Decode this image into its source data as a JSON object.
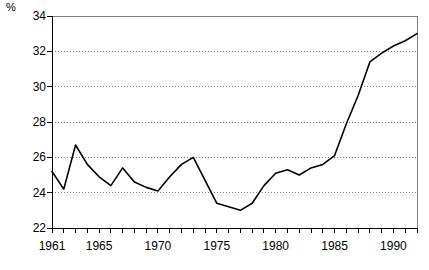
{
  "chart_data": {
    "type": "line",
    "title": "",
    "xlabel": "",
    "ylabel": "%",
    "ylim": [
      22,
      34
    ],
    "xlim": [
      1961,
      1992
    ],
    "ytick_step": 2,
    "yticks": [
      22,
      24,
      26,
      28,
      30,
      32,
      34
    ],
    "ytick_labels": [
      "22",
      "24",
      "26",
      "28",
      "30",
      "32",
      "34"
    ],
    "xticks": [
      1961,
      1965,
      1970,
      1975,
      1980,
      1985,
      1990
    ],
    "xtick_labels": [
      "1961",
      "1965",
      "1970",
      "1975",
      "1980",
      "1985",
      "1990"
    ],
    "xtick_minor_every": 1,
    "grid": "horizontal-dotted",
    "legend": "none",
    "line_color": "#000000",
    "grid_color": "#808080",
    "frame_color": "#808080",
    "x": [
      1961,
      1962,
      1963,
      1964,
      1965,
      1966,
      1967,
      1968,
      1969,
      1970,
      1971,
      1972,
      1973,
      1974,
      1975,
      1976,
      1977,
      1978,
      1979,
      1980,
      1981,
      1982,
      1983,
      1984,
      1985,
      1986,
      1987,
      1988,
      1989,
      1990,
      1991,
      1992
    ],
    "values": [
      25.2,
      24.2,
      26.7,
      25.6,
      24.9,
      24.4,
      25.4,
      24.6,
      24.3,
      24.1,
      24.9,
      25.6,
      26.0,
      24.7,
      23.4,
      23.2,
      23.0,
      23.4,
      24.4,
      25.1,
      25.3,
      25.0,
      25.4,
      25.6,
      26.1,
      27.9,
      29.5,
      31.4,
      31.9,
      32.3,
      32.6,
      33.0
    ],
    "series": [
      {
        "name": "percent-series",
        "values": [
          25.2,
          24.2,
          26.7,
          25.6,
          24.9,
          24.4,
          25.4,
          24.6,
          24.3,
          24.1,
          24.9,
          25.6,
          26.0,
          24.7,
          23.4,
          23.2,
          23.0,
          23.4,
          24.4,
          25.1,
          25.3,
          25.0,
          25.4,
          25.6,
          26.1,
          27.9,
          29.5,
          31.4,
          31.9,
          32.3,
          32.6,
          33.0
        ]
      }
    ]
  }
}
